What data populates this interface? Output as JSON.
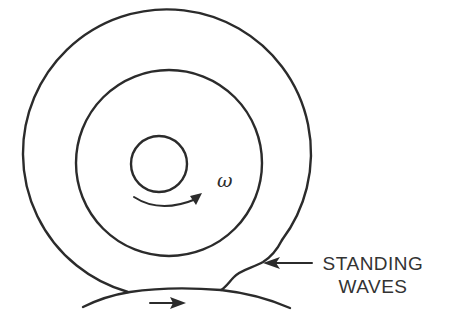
{
  "diagram": {
    "symbols": {
      "angular_velocity": "ω"
    },
    "labels": {
      "standing_line1": "STANDING",
      "standing_line2": "WAVES"
    },
    "colors": {
      "stroke": "#2b2b2b",
      "text": "#333333",
      "background": "#ffffff"
    },
    "parts": [
      "outer-tire-circle",
      "inner-rim-circle",
      "hub-circle",
      "rotation-arrow",
      "road-surface",
      "road-motion-arrow",
      "standing-wave-profile",
      "standing-wave-pointer-arrow"
    ]
  }
}
